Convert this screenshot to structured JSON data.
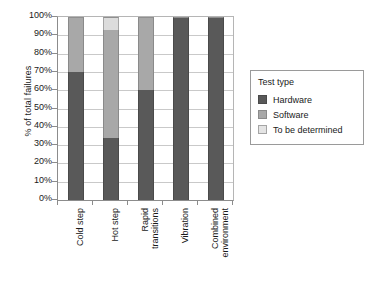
{
  "chart_data": {
    "type": "bar",
    "subtype": "stacked-100-percent",
    "title": "",
    "xlabel": "",
    "ylabel": "% of total failures",
    "ylim": [
      0,
      100
    ],
    "yticks": [
      "0%",
      "10%",
      "20%",
      "30%",
      "40%",
      "50%",
      "60%",
      "70%",
      "80%",
      "90%",
      "100%"
    ],
    "ytick_values": [
      0,
      10,
      20,
      30,
      40,
      50,
      60,
      70,
      80,
      90,
      100
    ],
    "grid": true,
    "legend_position": "right",
    "legend_title": "Test type",
    "categories": [
      {
        "lines": [
          "Cold step"
        ]
      },
      {
        "lines": [
          "Hot step"
        ]
      },
      {
        "lines": [
          "Rapid",
          "transitions"
        ]
      },
      {
        "lines": [
          "Vibration"
        ]
      },
      {
        "lines": [
          "Combined",
          "environment"
        ]
      }
    ],
    "category_labels": [
      "Cold step",
      "Hot step",
      "Rapid transitions",
      "Vibration",
      "Combined environment"
    ],
    "series": [
      {
        "name": "Hardware",
        "color": "#595959",
        "values": [
          70,
          34,
          60,
          100,
          100
        ]
      },
      {
        "name": "Software",
        "color": "#a8a8a8",
        "values": [
          30,
          59,
          40,
          0,
          0
        ]
      },
      {
        "name": "To be determined",
        "color": "#dcdcdc",
        "values": [
          0,
          7,
          0,
          0,
          0
        ]
      }
    ]
  }
}
